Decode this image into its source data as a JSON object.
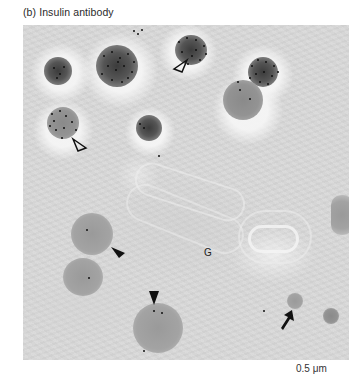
{
  "figure": {
    "panel_label": "(b) Insulin antibody",
    "structure_label": "G",
    "scale_bar_label": "0.5 μm",
    "colors": {
      "background": "#ffffff",
      "cytoplasm": "#d9d9d9",
      "dense_granule": "#3c3c3c",
      "immature_granule": "#939393",
      "gold_particle": "#111111",
      "text": "#2a2a2a"
    },
    "markers": [
      {
        "type": "open-arrowhead",
        "name": "open-arrowhead-top"
      },
      {
        "type": "open-arrowhead",
        "name": "open-arrowhead-left"
      },
      {
        "type": "filled-arrowhead",
        "name": "filled-arrowhead-left"
      },
      {
        "type": "filled-arrowhead",
        "name": "filled-arrowhead-bottom"
      },
      {
        "type": "arrow",
        "name": "arrow-bottom-right"
      }
    ]
  }
}
